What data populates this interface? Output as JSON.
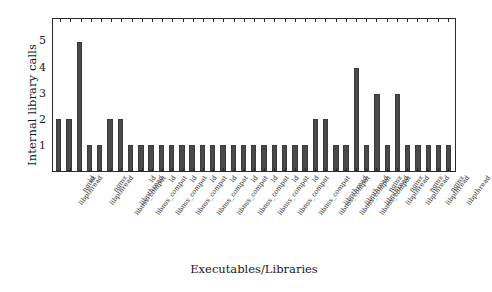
{
  "chart_data": {
    "type": "bar",
    "title": "",
    "xlabel": "Executables/Libraries",
    "ylabel": "Internal library calls",
    "ylim": [
      0,
      5.9
    ],
    "yticks": [
      1,
      2,
      3,
      4,
      5
    ],
    "ytick_labels": [
      "1",
      "2",
      "3",
      "4",
      "5"
    ],
    "grid": false,
    "legend": null,
    "bar_color": "#4a4a4a",
    "axis_color": "#2b2b2b",
    "categories": [
      "libpthread",
      "nginx",
      "ld",
      "libpthread",
      "nginx",
      "libnss_compat",
      "libpthread",
      "libnss_compat",
      "ld",
      "libnss_compat",
      "ld",
      "libnss_compat",
      "ld",
      "libnss_compat",
      "ld",
      "libnss_compat",
      "ld",
      "libnss_compat",
      "ld",
      "libnss_compat",
      "ld",
      "libnss_compat",
      "ld",
      "libnss_compat",
      "ld",
      "libnss_compat",
      "libpthread",
      "libnss_compat",
      "libpthread",
      "libnss_compat",
      "libpthread",
      "nginx",
      "libpthread",
      "nginx",
      "libpthread",
      "nginx",
      "libpthread",
      "nginx",
      "libpthread"
    ],
    "values": [
      2,
      2,
      5,
      1,
      1,
      2,
      2,
      1,
      1,
      1,
      1,
      1,
      1,
      1,
      1,
      1,
      1,
      1,
      1,
      1,
      1,
      1,
      1,
      1,
      1,
      2,
      2,
      1,
      1,
      4,
      1,
      3,
      1,
      3,
      1,
      1,
      1,
      1,
      1
    ]
  }
}
